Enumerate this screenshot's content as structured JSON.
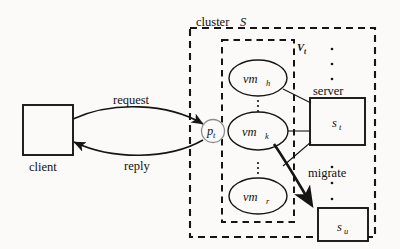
{
  "figure": {
    "type": "system-architecture-diagram"
  },
  "client": {
    "label": "client"
  },
  "edges": {
    "request_label": "request",
    "reply_label": "reply",
    "migrate_label": "migrate"
  },
  "process": {
    "base": "p",
    "subscript": "t"
  },
  "cluster": {
    "label_word": "cluster",
    "label_var": "S"
  },
  "vm_group": {
    "label_var": "V",
    "label_sub": "t",
    "vms": [
      {
        "base": "vm",
        "subscript": "h"
      },
      {
        "base": "vm",
        "subscript": "k"
      },
      {
        "base": "vm",
        "subscript": "r"
      }
    ]
  },
  "servers": {
    "caption": "server",
    "items": [
      {
        "base": "s",
        "subscript": "t"
      },
      {
        "base": "s",
        "subscript": "u"
      }
    ]
  },
  "colors": {
    "stroke": "#151515",
    "background": "#fbfaf8",
    "process_circle_stroke": "#8d8d8d"
  }
}
